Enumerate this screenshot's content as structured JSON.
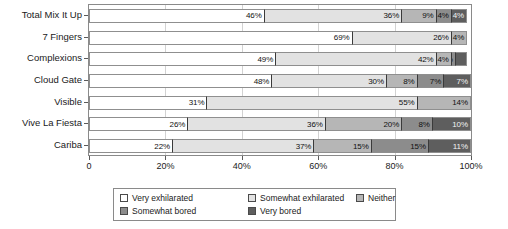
{
  "chart_data": {
    "type": "bar",
    "orientation": "horizontal",
    "stacked": true,
    "stack_mode": "percent",
    "title": "",
    "subtitle": "",
    "xlabel": "",
    "ylabel": "",
    "xlim": [
      0,
      100
    ],
    "xticks": [
      0,
      20,
      40,
      60,
      80,
      100
    ],
    "xtick_labels": [
      "0",
      "20%",
      "40%",
      "60%",
      "80%",
      "100%"
    ],
    "grid": true,
    "grid_axis": "x",
    "legend_position": "bottom",
    "categories": [
      "Total Mix It Up",
      "7 Fingers",
      "Complexions",
      "Cloud Gate",
      "Visible",
      "Vive La Fiesta",
      "Cariba"
    ],
    "series": [
      {
        "name": "Very exhilarated",
        "color": "#ffffff",
        "label_color": "dark",
        "values": [
          46,
          69,
          49,
          48,
          31,
          26,
          22
        ],
        "labels": [
          "46%",
          "69%",
          "49%",
          "48%",
          "31%",
          "26%",
          "22%"
        ]
      },
      {
        "name": "Somewhat exhilarated",
        "color": "#e2e2e2",
        "label_color": "dark",
        "values": [
          36,
          26,
          42,
          30,
          55,
          36,
          37
        ],
        "labels": [
          "36%",
          "26%",
          "42%",
          "30%",
          "55%",
          "36%",
          "37%"
        ]
      },
      {
        "name": "Neither",
        "color": "#b6b6b6",
        "label_color": "dark",
        "values": [
          9,
          4,
          4,
          8,
          14,
          20,
          15
        ],
        "labels": [
          "9%",
          "4%",
          "4%",
          "8%",
          "14%",
          "20%",
          "15%"
        ]
      },
      {
        "name": "Somewhat bored",
        "color": "#8c8c8c",
        "label_color": "dark",
        "values": [
          4,
          0,
          1,
          7,
          0,
          8,
          15
        ],
        "labels": [
          "4%",
          "",
          "1%",
          "7%",
          "",
          "8%",
          "15%"
        ]
      },
      {
        "name": "Very bored",
        "color": "#5e5e5e",
        "label_color": "light",
        "values": [
          4,
          0,
          3,
          7,
          0,
          10,
          11
        ],
        "labels": [
          "4%",
          "",
          "",
          "7%",
          "",
          "10%",
          "11%"
        ]
      }
    ]
  },
  "legend": {
    "items": [
      {
        "label": "Very exhilarated",
        "color": "#ffffff"
      },
      {
        "label": "Somewhat exhilarated",
        "color": "#e2e2e2"
      },
      {
        "label": "Neither",
        "color": "#b6b6b6"
      },
      {
        "label": "Somewhat bored",
        "color": "#8c8c8c"
      },
      {
        "label": "Very bored",
        "color": "#5e5e5e"
      }
    ]
  }
}
